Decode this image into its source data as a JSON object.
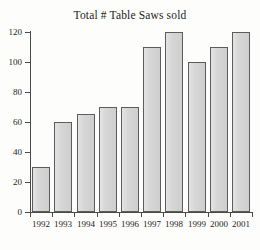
{
  "chart_data": {
    "type": "bar",
    "title": "Total # Table Saws sold",
    "xlabel": "",
    "ylabel": "",
    "categories": [
      "1992",
      "1993",
      "1994",
      "1995",
      "1996",
      "1997",
      "1998",
      "1999",
      "2000",
      "2001"
    ],
    "values": [
      30,
      60,
      65,
      70,
      70,
      110,
      120,
      100,
      110,
      120
    ],
    "ylim": [
      0,
      120
    ],
    "yticks": [
      0,
      20,
      40,
      60,
      80,
      100,
      120
    ],
    "ytick_labels": [
      "0",
      "20",
      "40",
      "60",
      "80",
      "100",
      "120"
    ],
    "grid": false,
    "legend": null,
    "bar_fill_color": "#d6d6d6",
    "bar_edge_color": "#5c5c5c",
    "background_color": "#fdfdfb",
    "axis_color": "#4a4a4a",
    "text_color": "#1d1d1d"
  }
}
